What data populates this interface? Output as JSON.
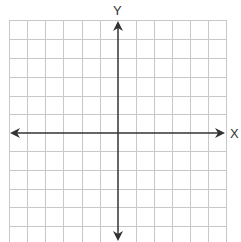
{
  "diagram": {
    "type": "coordinate-plane",
    "x_axis_label": "X",
    "y_axis_label": "Y",
    "grid": {
      "columns": 12,
      "rows": 12,
      "line_color": "#c8c8c8",
      "axis_color": "#333333"
    }
  }
}
